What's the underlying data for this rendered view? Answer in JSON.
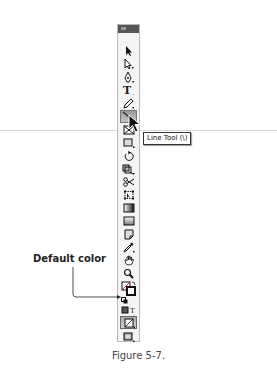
{
  "toolbar": {
    "title": "Tools",
    "tools": [
      {
        "name": "selection-tool",
        "icon": "arrow-icon"
      },
      {
        "name": "direct-selection-tool",
        "icon": "hollow-arrow-icon"
      },
      {
        "name": "pen-tool",
        "icon": "pen-icon"
      },
      {
        "name": "type-tool",
        "icon": "type-icon",
        "glyph": "T"
      },
      {
        "name": "pencil-tool",
        "icon": "pencil-icon"
      },
      {
        "name": "line-tool",
        "icon": "line-icon",
        "active": true
      },
      {
        "name": "rectangle-frame-tool",
        "icon": "frame-x-icon"
      },
      {
        "name": "rectangle-tool",
        "icon": "rectangle-icon"
      },
      {
        "name": "rotate-tool",
        "icon": "rotate-icon"
      },
      {
        "name": "scale-tool",
        "icon": "scale-icon"
      },
      {
        "name": "scissors-tool",
        "icon": "scissors-icon"
      },
      {
        "name": "free-transform-tool",
        "icon": "transform-icon"
      },
      {
        "name": "gradient-tool",
        "icon": "gradient-icon"
      },
      {
        "name": "gradient-feather-tool",
        "icon": "gradient-feather-icon"
      },
      {
        "name": "note-tool",
        "icon": "note-icon"
      },
      {
        "name": "eyedropper-tool",
        "icon": "eyedropper-icon"
      },
      {
        "name": "hand-tool",
        "icon": "hand-icon"
      },
      {
        "name": "zoom-tool",
        "icon": "magnifier-icon"
      },
      {
        "name": "fill-stroke-swatch",
        "icon": "fill-stroke-icon"
      },
      {
        "name": "default-color",
        "icon": "default-color-icon"
      },
      {
        "name": "formatting-container",
        "icon": "formatting-icon"
      },
      {
        "name": "apply-color",
        "icon": "apply-color-icon",
        "selected": true
      },
      {
        "name": "screen-mode",
        "icon": "screen-mode-icon"
      }
    ]
  },
  "tooltip": {
    "text": "Line Tool (\\)"
  },
  "callout": {
    "label": "Default color"
  },
  "caption": {
    "text": "Figure 5-7."
  },
  "colors": {
    "toolbar_bg": "#f4f4f4",
    "header": "#555555",
    "active_tool": "#a8a8a8"
  }
}
